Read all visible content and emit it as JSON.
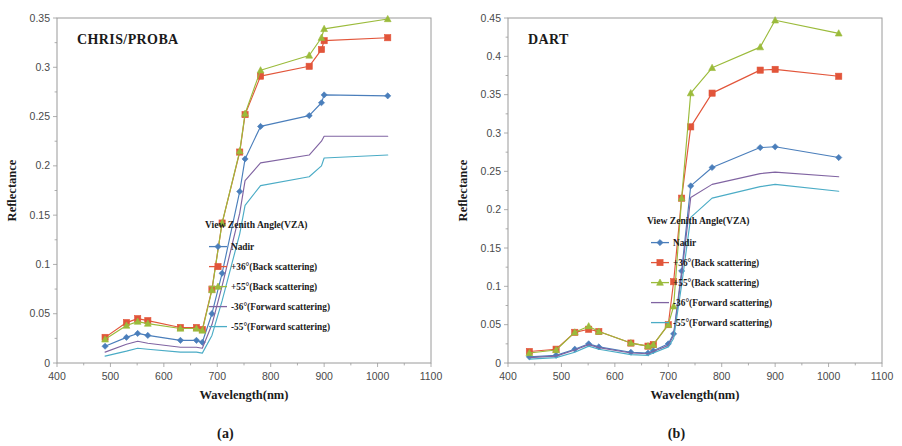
{
  "figure": {
    "panels": [
      {
        "id": "a",
        "subcaption": "(a)",
        "title": "CHRIS/PROBA",
        "xlabel": "Wavelength(nm)",
        "ylabel": "Reflectance",
        "legend_title": "View Zenith Angle(VZA)"
      },
      {
        "id": "b",
        "subcaption": "(b)",
        "title": "DART",
        "xlabel": "Wavelength(nm)",
        "ylabel": "Reflectance",
        "legend_title": "View Zenith Angle(VZA)"
      }
    ]
  },
  "colors": {
    "nadir": "#4a7ebb",
    "back36": "#e2553a",
    "back55": "#9bbb3b",
    "fwd36": "#8064a2",
    "fwd55": "#4bacc6",
    "axis": "#9a9a9a",
    "text": "#1a1a1a"
  },
  "chart_data": [
    {
      "type": "line",
      "title": "CHRIS/PROBA",
      "xlabel": "Wavelength(nm)",
      "ylabel": "Reflectance",
      "xlim": [
        400,
        1100
      ],
      "ylim": [
        0,
        0.35
      ],
      "xticks": [
        400,
        500,
        600,
        700,
        800,
        900,
        1000,
        1100
      ],
      "yticks": [
        0,
        0.05,
        0.1,
        0.15,
        0.2,
        0.25,
        0.3,
        0.35
      ],
      "ytick_labels": [
        "0",
        "0.05",
        "0.1",
        "0.15",
        "0.2",
        "0.25",
        "0.3",
        "0.35"
      ],
      "grid": false,
      "legend_position": "inside-lower-right",
      "legend_title": "View Zenith Angle(VZA)",
      "series": [
        {
          "name": "Nadir",
          "color": "#4a7ebb",
          "marker": "diamond",
          "x": [
            490,
            530,
            551,
            570,
            631,
            661,
            672,
            690,
            709,
            742,
            752,
            781,
            872,
            895,
            900,
            1019
          ],
          "y": [
            0.017,
            0.026,
            0.03,
            0.028,
            0.023,
            0.023,
            0.021,
            0.05,
            0.091,
            0.174,
            0.207,
            0.24,
            0.251,
            0.264,
            0.272,
            0.271
          ]
        },
        {
          "name": "+36°(Back scattering)",
          "color": "#e2553a",
          "marker": "square",
          "x": [
            490,
            530,
            551,
            570,
            631,
            661,
            672,
            690,
            709,
            742,
            752,
            781,
            872,
            895,
            900,
            1019
          ],
          "y": [
            0.026,
            0.041,
            0.045,
            0.043,
            0.036,
            0.036,
            0.034,
            0.075,
            0.142,
            0.214,
            0.252,
            0.291,
            0.301,
            0.318,
            0.327,
            0.33
          ]
        },
        {
          "name": "+55°(Back scattering)",
          "color": "#9bbb3b",
          "marker": "triangle",
          "x": [
            490,
            530,
            551,
            570,
            631,
            661,
            672,
            690,
            709,
            742,
            752,
            781,
            872,
            895,
            900,
            1019
          ],
          "y": [
            0.024,
            0.038,
            0.042,
            0.04,
            0.035,
            0.035,
            0.033,
            0.074,
            0.142,
            0.215,
            0.253,
            0.297,
            0.312,
            0.33,
            0.339,
            0.349
          ]
        },
        {
          "name": "-36°(Forward scattering)",
          "color": "#8064a2",
          "marker": "none",
          "x": [
            490,
            530,
            551,
            570,
            631,
            661,
            672,
            690,
            709,
            742,
            752,
            781,
            872,
            895,
            900,
            1019
          ],
          "y": [
            0.011,
            0.019,
            0.022,
            0.02,
            0.016,
            0.016,
            0.015,
            0.039,
            0.078,
            0.152,
            0.185,
            0.203,
            0.211,
            0.225,
            0.23,
            0.23
          ]
        },
        {
          "name": "-55°(Forward scattering)",
          "color": "#4bacc6",
          "marker": "none",
          "x": [
            490,
            530,
            551,
            570,
            631,
            661,
            672,
            690,
            709,
            742,
            752,
            781,
            872,
            895,
            900,
            1019
          ],
          "y": [
            0.007,
            0.012,
            0.015,
            0.014,
            0.011,
            0.011,
            0.01,
            0.028,
            0.063,
            0.131,
            0.16,
            0.18,
            0.189,
            0.2,
            0.208,
            0.211
          ]
        }
      ]
    },
    {
      "type": "line",
      "title": "DART",
      "xlabel": "Wavelength(nm)",
      "ylabel": "Reflectance",
      "xlim": [
        400,
        1100
      ],
      "ylim": [
        0,
        0.45
      ],
      "xticks": [
        400,
        500,
        600,
        700,
        800,
        900,
        1000,
        1100
      ],
      "yticks": [
        0,
        0.05,
        0.1,
        0.15,
        0.2,
        0.25,
        0.3,
        0.35,
        0.4,
        0.45
      ],
      "ytick_labels": [
        "0",
        "0.05",
        "0.1",
        "0.15",
        "0.2",
        "0.25",
        "0.3",
        "0.35",
        "0.4",
        "0.45"
      ],
      "grid": false,
      "legend_position": "inside-middle-right",
      "legend_title": "View Zenith Angle(VZA)",
      "series": [
        {
          "name": "Nadir",
          "color": "#4a7ebb",
          "marker": "diamond",
          "x": [
            440,
            490,
            525,
            551,
            570,
            630,
            662,
            672,
            700,
            710,
            725,
            742,
            782,
            872,
            900,
            1019
          ],
          "y": [
            0.008,
            0.01,
            0.018,
            0.025,
            0.021,
            0.014,
            0.013,
            0.016,
            0.025,
            0.038,
            0.12,
            0.231,
            0.255,
            0.281,
            0.282,
            0.268
          ]
        },
        {
          "name": "+36°(Back scattering)",
          "color": "#e2553a",
          "marker": "square",
          "x": [
            440,
            490,
            525,
            551,
            570,
            630,
            662,
            672,
            700,
            710,
            725,
            742,
            782,
            872,
            900,
            1019
          ],
          "y": [
            0.015,
            0.018,
            0.04,
            0.044,
            0.041,
            0.026,
            0.022,
            0.024,
            0.05,
            0.106,
            0.215,
            0.308,
            0.352,
            0.382,
            0.383,
            0.374
          ]
        },
        {
          "name": "+55°(Back scattering)",
          "color": "#9bbb3b",
          "marker": "triangle",
          "x": [
            440,
            490,
            525,
            551,
            570,
            630,
            662,
            672,
            700,
            710,
            725,
            742,
            782,
            872,
            900,
            1019
          ],
          "y": [
            0.013,
            0.017,
            0.04,
            0.048,
            0.041,
            0.026,
            0.022,
            0.024,
            0.05,
            0.074,
            0.215,
            0.352,
            0.385,
            0.412,
            0.447,
            0.43
          ]
        },
        {
          "name": "-36°(Forward scattering)",
          "color": "#8064a2",
          "marker": "none",
          "x": [
            440,
            490,
            525,
            551,
            570,
            630,
            662,
            672,
            700,
            710,
            725,
            742,
            782,
            872,
            900,
            1019
          ],
          "y": [
            0.007,
            0.009,
            0.017,
            0.024,
            0.02,
            0.013,
            0.012,
            0.015,
            0.023,
            0.036,
            0.115,
            0.216,
            0.233,
            0.247,
            0.249,
            0.243
          ]
        },
        {
          "name": "-55°(Forward scattering)",
          "color": "#4bacc6",
          "marker": "none",
          "x": [
            440,
            490,
            525,
            551,
            570,
            630,
            662,
            672,
            700,
            710,
            725,
            742,
            782,
            872,
            900,
            1019
          ],
          "y": [
            0.005,
            0.007,
            0.014,
            0.022,
            0.018,
            0.011,
            0.01,
            0.013,
            0.021,
            0.032,
            0.102,
            0.19,
            0.215,
            0.23,
            0.233,
            0.224
          ]
        }
      ]
    }
  ]
}
